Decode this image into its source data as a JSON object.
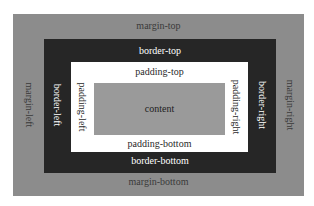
{
  "diagram": {
    "colors": {
      "margin": "#8c8c8c",
      "border": "#262626",
      "padding": "#ffffff",
      "content": "#9a9a9a",
      "margin_text": "#3a3a3a",
      "border_text": "#ffffff",
      "padding_text": "#2a2a2a",
      "content_text": "#1e1e1e"
    },
    "margin": {
      "top": "margin-top",
      "bottom": "margin-bottom",
      "left": "margin-left",
      "right": "margin-right"
    },
    "border": {
      "top": "border-top",
      "bottom": "border-bottom",
      "left": "border-left",
      "right": "border-right"
    },
    "padding": {
      "top": "padding-top",
      "bottom": "padding-bottom",
      "left": "padding-left",
      "right": "padding-right"
    },
    "content": {
      "label": "content"
    }
  }
}
